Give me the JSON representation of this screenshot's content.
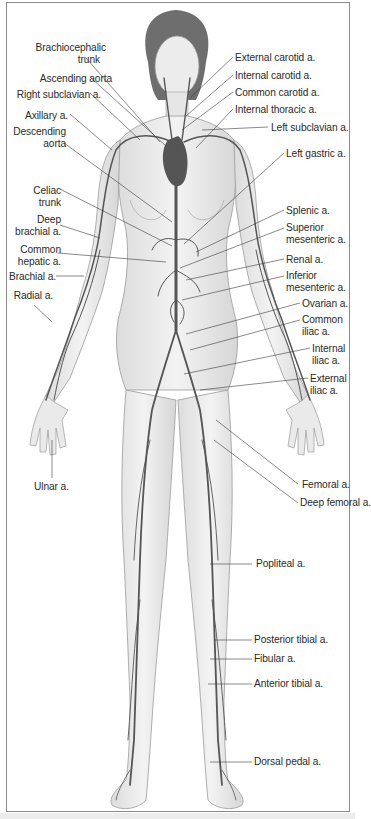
{
  "figure": {
    "colors": {
      "skin_shade": "#e4e4e4",
      "outline": "#9a9a9a",
      "artery": "#555555",
      "heart": "#5a5a5a",
      "leader": "#3a3a3a",
      "frame": "#8c8c8c"
    }
  },
  "labels_left": [
    {
      "id": "brachiocephalic-trunk",
      "text": "Brachiocephalic\ntrunk",
      "line1": "Brachiocephalic",
      "line2": "trunk",
      "x": 8,
      "y": 42,
      "w": 98
    },
    {
      "id": "ascending-aorta",
      "text": "Ascending aorta",
      "line1": "Ascending aorta",
      "line2": "",
      "x": 8,
      "y": 73,
      "w": 98
    },
    {
      "id": "right-subclavian-a",
      "text": "Right subclavian a.",
      "line1": "Right subclavian a.",
      "line2": "",
      "x": 8,
      "y": 89,
      "w": 98
    },
    {
      "id": "axillary-a",
      "text": "Axillary a.",
      "line1": "Axillary a.",
      "line2": "",
      "x": 8,
      "y": 110,
      "w": 61
    },
    {
      "id": "descending-aorta",
      "text": "Descending\naorta",
      "line1": "Descending",
      "line2": "aorta",
      "x": 8,
      "y": 126,
      "w": 61
    },
    {
      "id": "celiac-trunk",
      "text": "Celiac\ntrunk",
      "line1": "Celiac",
      "line2": "trunk",
      "x": 8,
      "y": 185,
      "w": 53
    },
    {
      "id": "deep-brachial-a",
      "text": "Deep\nbrachial a.",
      "line1": "Deep",
      "line2": "brachial a.",
      "x": 8,
      "y": 214,
      "w": 53
    },
    {
      "id": "common-hepatic-a",
      "text": "Common\nhepatic a.",
      "line1": "Common",
      "line2": "hepatic a.",
      "x": 8,
      "y": 244,
      "w": 53
    },
    {
      "id": "brachial-a",
      "text": "Brachial a.",
      "line1": "Brachial a.",
      "line2": "",
      "x": 8,
      "y": 272,
      "w": 53
    },
    {
      "id": "radial-a",
      "text": "Radial a.",
      "line1": "Radial a.",
      "line2": "",
      "x": 8,
      "y": 291,
      "w": 49
    },
    {
      "id": "ulnar-a",
      "text": "Ulnar a.",
      "line1": "Ulnar a.",
      "line2": "",
      "x": 35,
      "y": 481,
      "w": 60
    }
  ],
  "labels_right": [
    {
      "id": "external-carotid-a",
      "line1": "External carotid a.",
      "line2": "",
      "x": 235,
      "y": 52
    },
    {
      "id": "internal-carotid-a",
      "line1": "Internal carotid a.",
      "line2": "",
      "x": 235,
      "y": 70
    },
    {
      "id": "common-carotid-a",
      "line1": "Common carotid a.",
      "line2": "",
      "x": 235,
      "y": 87
    },
    {
      "id": "internal-thoracic-a",
      "line1": "Internal thoracic a.",
      "line2": "",
      "x": 235,
      "y": 104
    },
    {
      "id": "left-subclavian-a",
      "line1": "Left subclavian a.",
      "line2": "",
      "x": 271,
      "y": 122
    },
    {
      "id": "left-gastric-a",
      "line1": "Left gastric a.",
      "line2": "",
      "x": 286,
      "y": 148
    },
    {
      "id": "splenic-a",
      "line1": "Splenic a.",
      "line2": "",
      "x": 286,
      "y": 205
    },
    {
      "id": "superior-mesenteric-a",
      "line1": "Superior",
      "line2": "mesenteric a.",
      "x": 286,
      "y": 222
    },
    {
      "id": "renal-a",
      "line1": "Renal a.",
      "line2": "",
      "x": 286,
      "y": 254
    },
    {
      "id": "inferior-mesenteric-a",
      "line1": "Inferior",
      "line2": "mesenteric a.",
      "x": 286,
      "y": 270
    },
    {
      "id": "ovarian-a",
      "line1": "Ovarian a.",
      "line2": "",
      "x": 302,
      "y": 298
    },
    {
      "id": "common-iliac-a",
      "line1": "Common",
      "line2": "iliac a.",
      "x": 302,
      "y": 314
    },
    {
      "id": "internal-iliac-a",
      "line1": "Internal",
      "line2": "iliac a.",
      "x": 312,
      "y": 343
    },
    {
      "id": "external-iliac-a",
      "line1": "External",
      "line2": "iliac a.",
      "x": 310,
      "y": 373
    },
    {
      "id": "femoral-a",
      "line1": "Femoral a.",
      "line2": "",
      "x": 302,
      "y": 482
    },
    {
      "id": "deep-femoral-a",
      "line1": "Deep femoral a.",
      "line2": "",
      "x": 300,
      "y": 498
    },
    {
      "id": "popliteal-a",
      "line1": "Popliteal a.",
      "line2": "",
      "x": 256,
      "y": 559
    },
    {
      "id": "posterior-tibial-a",
      "line1": "Posterior tibial a.",
      "line2": "",
      "x": 254,
      "y": 635
    },
    {
      "id": "fibular-a",
      "line1": "Fibular a.",
      "line2": "",
      "x": 254,
      "y": 654
    },
    {
      "id": "anterior-tibial-a",
      "line1": "Anterior tibial a.",
      "line2": "",
      "x": 254,
      "y": 679
    },
    {
      "id": "dorsal-pedal-a",
      "line1": "Dorsal pedal a.",
      "line2": "",
      "x": 254,
      "y": 757
    }
  ]
}
